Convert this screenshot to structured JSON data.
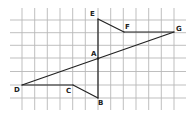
{
  "diagram": {
    "type": "geometry-figure-on-grid",
    "grid": {
      "color": "#b8b8b8",
      "vertical_x": [
        22,
        34.7,
        47.3,
        60,
        72.7,
        85.3,
        98,
        110.7,
        123.3,
        136,
        148.7,
        161.3,
        174
      ],
      "horizontal_y": [
        20,
        32.7,
        45.3,
        58,
        71.5,
        85,
        98
      ],
      "v_extent": [
        8,
        110
      ],
      "h_extent": [
        10,
        186
      ]
    },
    "stroke_color": "#222222",
    "points": {
      "A": {
        "x": 98,
        "y": 58.5,
        "label": "A",
        "lx": 91,
        "ly": 51
      },
      "B": {
        "x": 98,
        "y": 98,
        "label": "B",
        "lx": 98,
        "ly": 100
      },
      "C": {
        "x": 73,
        "y": 85,
        "label": "C",
        "lx": 66,
        "ly": 88
      },
      "D": {
        "x": 22,
        "y": 85,
        "label": "D",
        "lx": 14,
        "ly": 87
      },
      "E": {
        "x": 98,
        "y": 19,
        "label": "E",
        "lx": 90,
        "ly": 11
      },
      "F": {
        "x": 124,
        "y": 32,
        "label": "F",
        "lx": 125,
        "ly": 24
      },
      "G": {
        "x": 174,
        "y": 32,
        "label": "G",
        "lx": 176,
        "ly": 26
      }
    },
    "segments": [
      [
        "E",
        "F"
      ],
      [
        "F",
        "G"
      ],
      [
        "G",
        "D"
      ],
      [
        "D",
        "C"
      ],
      [
        "C",
        "B"
      ],
      [
        "B",
        "E"
      ]
    ]
  }
}
